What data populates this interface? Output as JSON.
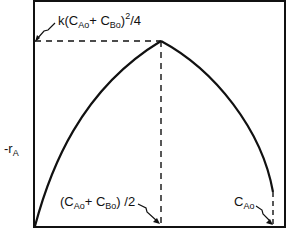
{
  "diagram": {
    "type": "rate-vs-concentration curve",
    "y_axis_label": "-r",
    "y_axis_label_sub": "A",
    "peak_label": {
      "prefix": "k(C",
      "sub1": "Ao",
      "mid": "+ C",
      "sub2": "Bo",
      "close": ")",
      "exp": "2",
      "suffix": "/4"
    },
    "x_mid_label": {
      "prefix": "(C",
      "sub1": "Ao",
      "mid": "+ C",
      "sub2": "Bo",
      "suffix": ") /2"
    },
    "x_end_label": {
      "prefix": "C",
      "sub": "Ao"
    },
    "colors": {
      "line": "#111111",
      "background": "#ffffff"
    }
  }
}
